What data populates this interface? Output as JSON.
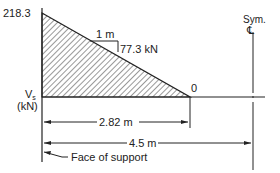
{
  "diagram": {
    "type": "shear-force-diagram",
    "max_value_label": "218.3",
    "zero_label": "0",
    "slope": {
      "run_label": "1 m",
      "rise_label": "77.3 kN"
    },
    "axis_label_line1": "V",
    "axis_label_sub": "s",
    "axis_label_line2": "(kN)",
    "symmetry_label": "Sym.",
    "centerline_symbol": "℄",
    "dimensions": [
      {
        "label": "2.82 m"
      },
      {
        "label": "4.5 m"
      }
    ],
    "support_note": "Face of support"
  },
  "colors": {
    "line": "#222222",
    "hatch": "#333333",
    "background": "#ffffff"
  }
}
